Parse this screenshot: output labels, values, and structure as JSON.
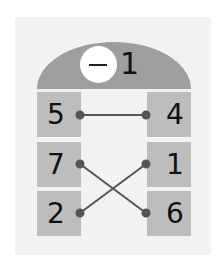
{
  "dome": {
    "operator": "−",
    "number": "1"
  },
  "left_column": [
    "5",
    "7",
    "2"
  ],
  "right_column": [
    "4",
    "1",
    "6"
  ],
  "connections": [
    {
      "from": "5",
      "to": "4"
    },
    {
      "from": "7",
      "to": "6"
    },
    {
      "from": "2",
      "to": "1"
    }
  ],
  "colors": {
    "card": "#f2f2f2",
    "dome": "#9e9e9e",
    "box": "#bdbdbd",
    "line": "#555555"
  }
}
